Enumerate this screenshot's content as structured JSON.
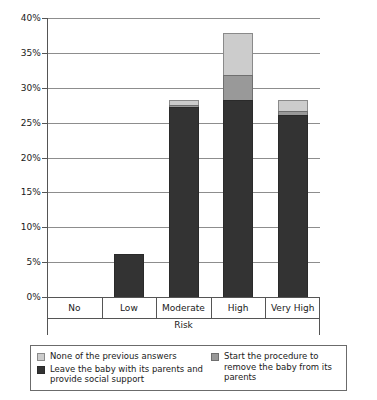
{
  "chart_data": {
    "type": "bar",
    "subtype": "stacked-bar",
    "title": "",
    "xlabel": "Risk",
    "ylabel": "",
    "categories": [
      "No",
      "Low",
      "Moderate",
      "High",
      "Very High"
    ],
    "ylim": [
      0,
      40
    ],
    "ytick_labels": [
      "0%",
      "5%",
      "10%",
      "15%",
      "20%",
      "25%",
      "30%",
      "35%",
      "40%"
    ],
    "ytick_values": [
      0,
      5,
      10,
      15,
      20,
      25,
      30,
      35,
      40
    ],
    "grid": true,
    "legend_position": "bottom",
    "series": [
      {
        "name": "Leave the baby with its parents and provide social support",
        "color": "#333333",
        "values": [
          0,
          6.2,
          27.2,
          28.3,
          26.1
        ]
      },
      {
        "name": "Start the procedure to remove the baby from its parents",
        "color": "#999999",
        "values": [
          0,
          0,
          0.4,
          3.5,
          0.5
        ]
      },
      {
        "name": "None of the previous answers",
        "color": "#cccccc",
        "values": [
          0,
          0,
          0.7,
          6.0,
          1.7
        ]
      }
    ],
    "stack_totals": [
      0,
      6.2,
      28.3,
      37.8,
      28.3
    ]
  },
  "legend": {
    "entries": [
      {
        "label": "None of the previous answers",
        "color": "#cccccc",
        "swatch": "light",
        "column": "left"
      },
      {
        "label": "Leave the baby with its parents and provide social support",
        "color": "#333333",
        "swatch": "dark",
        "column": "left"
      },
      {
        "label": "Start the procedure to remove the baby from its parents",
        "color": "#999999",
        "swatch": "medium",
        "column": "right"
      }
    ]
  }
}
